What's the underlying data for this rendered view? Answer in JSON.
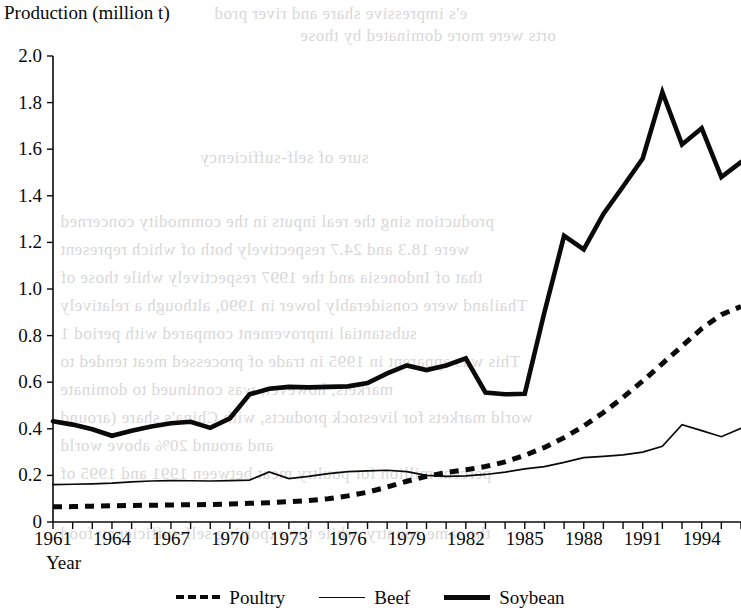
{
  "page": {
    "background_color": "#ffffff",
    "ink_color": "#0a0a0a",
    "bleed_text": [
      "e's impressive share and river prod",
      "orts were more dominated by those",
      "sure of self-sufficiency",
      "production  sing the real inputs in the commodity concerned",
      "were 18.3 and 24.7 respectively both of which represent",
      "that of Indonesia and the 1997 respectively while those of",
      "Thailand were considerably lower in 1990, although a relatively",
      "substantial improvement compared with period 1",
      "This was apparent in 1995 in trade of processed meat tended to",
      "markets, however, was continued to dominate",
      "world markets for livestock products, with China's share (around",
      "and around 20% above world",
      "percent million for poultry meat between 1991 and 1995 of",
      "the same country, while the exporting self-sufficiency food"
    ]
  },
  "chart_data": {
    "type": "line",
    "title": "",
    "ylabel": "Production (million t)",
    "xlabel": "Year",
    "xlim": [
      1961,
      1996
    ],
    "ylim": [
      0,
      2.0
    ],
    "yticks": [
      "2.0",
      "1.8",
      "1.6",
      "1.4",
      "1.2",
      "1.0",
      "0.8",
      "0.6",
      "0.4",
      "0.2",
      "0"
    ],
    "ytick_values": [
      2.0,
      1.8,
      1.6,
      1.4,
      1.2,
      1.0,
      0.8,
      0.6,
      0.4,
      0.2,
      0
    ],
    "xticks": [
      "1961",
      "1964",
      "1967",
      "1970",
      "1973",
      "1976",
      "1979",
      "1982",
      "1985",
      "1988",
      "1991",
      "1994"
    ],
    "xtick_values": [
      1961,
      1964,
      1967,
      1970,
      1973,
      1976,
      1979,
      1982,
      1985,
      1988,
      1991,
      1994
    ],
    "x": [
      1961,
      1962,
      1963,
      1964,
      1965,
      1966,
      1967,
      1968,
      1969,
      1970,
      1971,
      1972,
      1973,
      1974,
      1975,
      1976,
      1977,
      1978,
      1979,
      1980,
      1981,
      1982,
      1983,
      1984,
      1985,
      1986,
      1987,
      1988,
      1989,
      1990,
      1991,
      1992,
      1993,
      1994,
      1995,
      1996
    ],
    "grid": false,
    "legend_position": "bottom-center",
    "series": [
      {
        "name": "Poultry",
        "style": "dashed",
        "color": "#0a0a0a",
        "values": [
          0.065,
          0.066,
          0.068,
          0.07,
          0.071,
          0.072,
          0.073,
          0.074,
          0.075,
          0.077,
          0.08,
          0.083,
          0.087,
          0.092,
          0.1,
          0.112,
          0.128,
          0.15,
          0.175,
          0.196,
          0.212,
          0.224,
          0.238,
          0.258,
          0.286,
          0.32,
          0.362,
          0.412,
          0.47,
          0.535,
          0.605,
          0.68,
          0.755,
          0.83,
          0.89,
          0.925
        ]
      },
      {
        "name": "Beef",
        "style": "thin-solid",
        "color": "#0a0a0a",
        "values": [
          0.16,
          0.162,
          0.164,
          0.167,
          0.172,
          0.176,
          0.178,
          0.177,
          0.176,
          0.178,
          0.18,
          0.215,
          0.186,
          0.196,
          0.208,
          0.216,
          0.219,
          0.222,
          0.216,
          0.2,
          0.196,
          0.198,
          0.204,
          0.214,
          0.228,
          0.238,
          0.256,
          0.276,
          0.282,
          0.288,
          0.3,
          0.325,
          0.418,
          0.392,
          0.366,
          0.402
        ]
      },
      {
        "name": "Soybean",
        "style": "thick-solid",
        "color": "#0a0a0a",
        "values": [
          0.432,
          0.418,
          0.398,
          0.37,
          0.392,
          0.41,
          0.424,
          0.43,
          0.404,
          0.445,
          0.548,
          0.572,
          0.58,
          0.578,
          0.58,
          0.582,
          0.596,
          0.638,
          0.672,
          0.652,
          0.672,
          0.702,
          0.556,
          0.548,
          0.55,
          0.9,
          1.228,
          1.17,
          1.322,
          1.44,
          1.56,
          1.845,
          1.62,
          1.69,
          1.48,
          1.545
        ]
      }
    ]
  },
  "legend": {
    "items": [
      {
        "label": "Poultry",
        "style": "dashed"
      },
      {
        "label": "Beef",
        "style": "thin-solid"
      },
      {
        "label": "Soybean",
        "style": "thick-solid"
      }
    ]
  }
}
